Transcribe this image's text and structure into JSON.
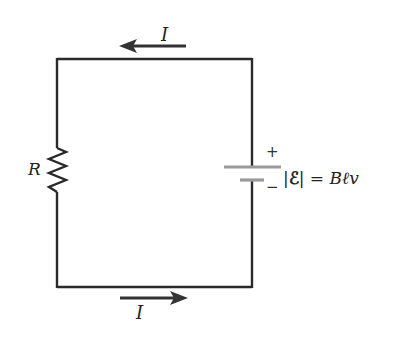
{
  "diagram": {
    "type": "circuit",
    "colors": {
      "wire": "#2a2a2a",
      "battery_plate": "#9a9a9a",
      "arrow": "#333333",
      "text": "#222222"
    },
    "current_top": {
      "label": "I",
      "direction": "left"
    },
    "current_bottom": {
      "label": "I",
      "direction": "right"
    },
    "resistor": {
      "label": "R"
    },
    "battery": {
      "positive_sign": "+",
      "negative_sign": "−"
    },
    "emf_equation": {
      "abs_open": "|",
      "symbol": "ℰ",
      "abs_close": "|",
      "equals": " = ",
      "B": "B",
      "l": "ℓ",
      "v": "v"
    }
  }
}
